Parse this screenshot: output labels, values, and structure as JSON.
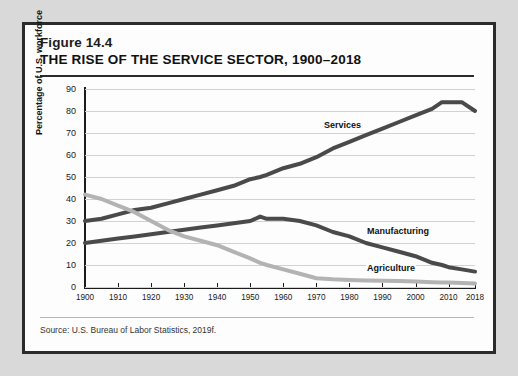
{
  "figure": {
    "number": "Figure 14.4",
    "title": "THE RISE OF THE SERVICE SECTOR, 1900–2018",
    "source": "Source: U.S. Bureau of Labor Statistics, 2019f."
  },
  "colors": {
    "page_background": "#d9d9d9",
    "panel_background": "#fdfdfd",
    "border": "#2b2b2b",
    "axis": "#1c1c1c",
    "grid": "#d2d2d2",
    "services": "#4a4a4a",
    "manufacturing": "#4a4a4a",
    "agriculture": "#b3b3b3"
  },
  "chart_data": {
    "type": "line",
    "title": "THE RISE OF THE SERVICE SECTOR, 1900–2018",
    "subtitle": "Figure 14.4",
    "xlabel": "",
    "ylabel": "Percentage of U.S. workforce",
    "xlim": [
      1900,
      2018
    ],
    "ylim": [
      0,
      90
    ],
    "grid": true,
    "legend": "inline-labels",
    "source": "Source: U.S. Bureau of Labor Statistics, 2019f.",
    "xticks": [
      1900,
      1910,
      1920,
      1930,
      1940,
      1950,
      1960,
      1970,
      1980,
      1990,
      2000,
      2010,
      2018
    ],
    "xtick_labels": [
      "1900",
      "1910",
      "1920",
      "1930",
      "1940",
      "1950",
      "1960",
      "1970",
      "1980",
      "1990",
      "2000",
      "2010",
      "2018"
    ],
    "yticks": [
      0,
      10,
      20,
      30,
      40,
      50,
      60,
      70,
      80,
      90
    ],
    "ytick_labels": [
      "0",
      "10",
      "20",
      "30",
      "40",
      "50",
      "60",
      "70",
      "80",
      "90"
    ],
    "x": [
      1900,
      1905,
      1910,
      1915,
      1920,
      1925,
      1930,
      1935,
      1940,
      1945,
      1950,
      1953,
      1955,
      1960,
      1965,
      1970,
      1975,
      1980,
      1985,
      1990,
      1995,
      2000,
      2005,
      2008,
      2010,
      2014,
      2018
    ],
    "series": [
      {
        "name": "Services",
        "color": "#4a4a4a",
        "label_x": 1972,
        "label_y": 73,
        "values": [
          30,
          31,
          33,
          35,
          36,
          38,
          40,
          42,
          44,
          46,
          49,
          50,
          51,
          54,
          56,
          59,
          63,
          66,
          69,
          72,
          75,
          78,
          81,
          84,
          84,
          84,
          80
        ]
      },
      {
        "name": "Manufacturing",
        "color": "#4a4a4a",
        "label_x": 1985,
        "label_y": 25,
        "values": [
          20,
          21,
          22,
          23,
          24,
          25,
          26,
          27,
          28,
          29,
          30,
          32,
          31,
          31,
          30,
          28,
          25,
          23,
          20,
          18,
          16,
          14,
          11,
          10,
          9,
          8,
          7
        ]
      },
      {
        "name": "Agriculture",
        "color": "#b3b3b3",
        "label_x": 1985,
        "label_y": 8,
        "values": [
          42,
          40,
          37,
          34,
          30,
          26,
          23,
          21,
          19,
          16,
          13,
          11,
          10,
          8,
          6,
          4,
          3.5,
          3.2,
          3,
          2.8,
          2.7,
          2.5,
          2.2,
          2,
          2,
          1.8,
          1.6
        ]
      }
    ]
  }
}
